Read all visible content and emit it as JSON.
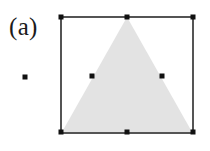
{
  "figure": {
    "panel_label": "(a)",
    "background_color": "#ffffff",
    "frame": {
      "name": "bounding-square",
      "x": 61,
      "y": 17,
      "width": 132,
      "height": 116,
      "stroke_color": "#2b2b2b",
      "stroke_width": 1.6,
      "fill": "none"
    },
    "triangle": {
      "name": "filled-triangle",
      "fill_color": "#e3e3e3",
      "stroke": "none",
      "apex": {
        "x": 127,
        "y": 17
      },
      "base_left": {
        "x": 62,
        "y": 132
      },
      "base_right": {
        "x": 192,
        "y": 132
      },
      "points": "127,17 192,132 62,132"
    },
    "marker_style": {
      "shape": "square",
      "size": 5,
      "color": "#111111"
    },
    "markers": [
      {
        "name": "marker-frame-top-left",
        "x": 61,
        "y": 17,
        "label": "top-left corner"
      },
      {
        "name": "marker-frame-top-center",
        "x": 127,
        "y": 17,
        "label": "top edge midpoint / triangle apex"
      },
      {
        "name": "marker-frame-top-right",
        "x": 193,
        "y": 17,
        "label": "top-right corner"
      },
      {
        "name": "marker-triangle-left-mid",
        "x": 92,
        "y": 76,
        "label": "left slant midpoint"
      },
      {
        "name": "marker-triangle-right-mid",
        "x": 162,
        "y": 76,
        "label": "right slant midpoint"
      },
      {
        "name": "marker-frame-bottom-left",
        "x": 61,
        "y": 132,
        "label": "bottom-left corner"
      },
      {
        "name": "marker-frame-bottom-center",
        "x": 127,
        "y": 132,
        "label": "bottom edge midpoint"
      },
      {
        "name": "marker-frame-bottom-right",
        "x": 193,
        "y": 132,
        "label": "bottom-right corner"
      }
    ],
    "outside_marker": {
      "name": "isolated-point",
      "x": 25,
      "y": 77,
      "size": 5,
      "color": "#111111"
    }
  }
}
